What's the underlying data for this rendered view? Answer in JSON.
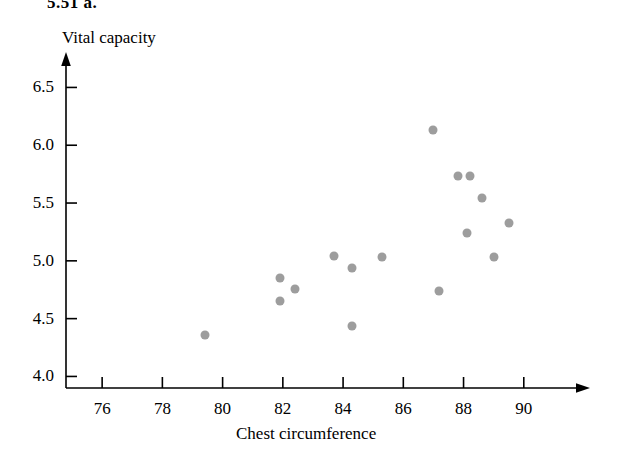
{
  "exercise": {
    "label": "5.51 a."
  },
  "chart_data": {
    "type": "scatter",
    "title": "",
    "xlabel": "Chest circumference",
    "ylabel": "Vital capacity",
    "xlim": [
      74.8,
      91.8
    ],
    "ylim": [
      3.9,
      6.72
    ],
    "xticks": [
      76,
      78,
      80,
      82,
      84,
      86,
      88,
      90
    ],
    "yticks": [
      4.0,
      4.5,
      5.0,
      5.5,
      6.0,
      6.5
    ],
    "xtick_labels": [
      "76",
      "78",
      "80",
      "82",
      "84",
      "86",
      "88",
      "90"
    ],
    "ytick_labels": [
      "4.0",
      "4.5",
      "5.0",
      "5.5",
      "6.0",
      "6.5"
    ],
    "grid": false,
    "legend": null,
    "point_color": "#9d9d9d",
    "axis_color": "#000000",
    "x": [
      79.4,
      81.9,
      82.4,
      81.9,
      83.7,
      84.3,
      85.3,
      84.3,
      87.0,
      87.8,
      88.2,
      88.6,
      88.1,
      89.5,
      89.0,
      87.2
    ],
    "y": [
      4.36,
      4.85,
      4.76,
      4.65,
      5.04,
      4.94,
      5.03,
      4.44,
      6.13,
      5.73,
      5.73,
      5.54,
      5.24,
      5.33,
      5.03,
      4.74
    ],
    "points": [
      {
        "x": 79.4,
        "y": 4.36
      },
      {
        "x": 81.9,
        "y": 4.85
      },
      {
        "x": 82.4,
        "y": 4.76
      },
      {
        "x": 81.9,
        "y": 4.65
      },
      {
        "x": 83.7,
        "y": 5.04
      },
      {
        "x": 84.3,
        "y": 4.94
      },
      {
        "x": 85.3,
        "y": 5.03
      },
      {
        "x": 84.3,
        "y": 4.44
      },
      {
        "x": 87.0,
        "y": 6.13
      },
      {
        "x": 87.8,
        "y": 5.73
      },
      {
        "x": 88.2,
        "y": 5.73
      },
      {
        "x": 88.6,
        "y": 5.54
      },
      {
        "x": 88.1,
        "y": 5.24
      },
      {
        "x": 89.5,
        "y": 5.33
      },
      {
        "x": 89.0,
        "y": 5.03
      },
      {
        "x": 87.2,
        "y": 4.74
      }
    ]
  }
}
